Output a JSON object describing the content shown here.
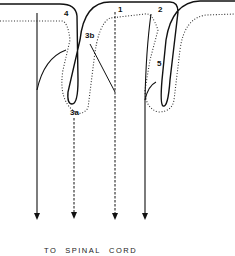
{
  "diagram": {
    "type": "anatomical-schematic",
    "labels": {
      "l1": "1",
      "l2": "2",
      "l3a": "3a",
      "l3b": "3b",
      "l4": "4",
      "l5": "5"
    },
    "caption": {
      "word1": "TO",
      "word2": "SPINAL",
      "word3": "CORD"
    },
    "nerve_fibers": [
      {
        "id": "fiber-4",
        "style": "solid",
        "x": 37
      },
      {
        "id": "fiber-3a",
        "style": "dashed",
        "x": 74
      },
      {
        "id": "fiber-1-3b",
        "style": "dashed",
        "x": 115
      },
      {
        "id": "fiber-2-5",
        "style": "solid",
        "x": 145
      }
    ],
    "colors": {
      "stroke": "#111111",
      "background": "#ffffff"
    }
  }
}
